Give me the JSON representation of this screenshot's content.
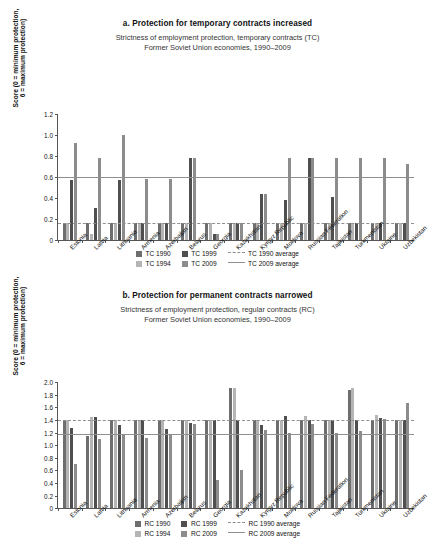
{
  "chart_data": [
    {
      "type": "bar",
      "id": "panel-a",
      "title": "a. Protection for temporary contracts increased",
      "subtitle_line1": "Strictness of employment protection, temporary contracts (TC)",
      "subtitle_line2": "Former Soviet Union economies, 1990–2009",
      "ylabel": "Score (0 = minimum protection,\n6 = maximum protection)",
      "xlabel": "",
      "ylim": [
        0,
        1.2
      ],
      "ytick_step": 0.2,
      "yticks": [
        "0",
        "0.2",
        "0.4",
        "0.6",
        "0.8",
        "1.0",
        "1.2"
      ],
      "grid": false,
      "legend_position": "bottom",
      "categories": [
        "Estonia",
        "Latvia",
        "Lithuania",
        "Armenia",
        "Azerbaijan",
        "Belarus",
        "Georgia",
        "Kazakhstan",
        "Kyrgyz Republic",
        "Moldova",
        "Russian Federation",
        "Tajikistan",
        "Turkmenistan",
        "Ukraine",
        "Uzbekistan"
      ],
      "series": [
        {
          "name": "TC 1990",
          "color": "#6e6e6e",
          "values": [
            0.16,
            0.16,
            0.16,
            0.16,
            0.16,
            0.16,
            0.16,
            0.16,
            0.16,
            0.16,
            0.16,
            0.16,
            0.16,
            0.16,
            0.16
          ]
        },
        {
          "name": "TC 1994",
          "color": "#b5b5b5",
          "values": [
            0.16,
            0.06,
            0.16,
            0.16,
            0.16,
            0.16,
            0.16,
            0.16,
            0.16,
            0.16,
            0.16,
            0.16,
            0.16,
            0.16,
            0.16
          ]
        },
        {
          "name": "TC 1999",
          "color": "#4f4f4f",
          "values": [
            0.57,
            0.31,
            0.57,
            0.16,
            0.16,
            0.78,
            0.06,
            0.16,
            0.44,
            0.38,
            0.78,
            0.41,
            0.16,
            0.16,
            0.16
          ]
        },
        {
          "name": "TC 2009",
          "color": "#8c8c8c",
          "values": [
            0.93,
            0.78,
            1.0,
            0.58,
            0.58,
            0.78,
            0.06,
            0.16,
            0.44,
            0.78,
            0.78,
            0.78,
            0.78,
            0.78,
            0.73
          ]
        }
      ],
      "reference_lines": [
        {
          "name": "TC 1990 average",
          "value": 0.16,
          "style": "dashed",
          "color": "#8f8f8f"
        },
        {
          "name": "TC 2009 average",
          "value": 0.6,
          "style": "solid",
          "color": "#8f8f8f"
        }
      ]
    },
    {
      "type": "bar",
      "id": "panel-b",
      "title": "b. Protection for permanent contracts narrowed",
      "subtitle_line1": "Strictness of employment protection, regular contracts (RC)",
      "subtitle_line2": "Former Soviet Union economies, 1990–2009",
      "ylabel": "Score (0 = minimum protection,\n6 = maximum protection)",
      "xlabel": "",
      "ylim": [
        0,
        2.0
      ],
      "ytick_step": 0.2,
      "yticks": [
        "0",
        "0.2",
        "0.4",
        "0.6",
        "0.8",
        "1.0",
        "1.2",
        "1.4",
        "1.6",
        "1.8",
        "2.0"
      ],
      "grid": false,
      "legend_position": "bottom",
      "categories": [
        "Estonia",
        "Latvia",
        "Lithuania",
        "Armenia",
        "Azerbaijan",
        "Belarus",
        "Georgia",
        "Kazakhstan",
        "Kyrgyz Republic",
        "Moldova",
        "Russian Federation",
        "Tajikistan",
        "Turkmenistan",
        "Ukraine",
        "Uzbekistan"
      ],
      "series": [
        {
          "name": "RC 1990",
          "color": "#6e6e6e",
          "values": [
            1.4,
            1.14,
            1.4,
            1.4,
            1.4,
            1.4,
            1.4,
            1.91,
            1.4,
            1.4,
            1.4,
            1.4,
            1.88,
            1.4,
            1.4
          ]
        },
        {
          "name": "RC 1994",
          "color": "#b5b5b5",
          "values": [
            1.4,
            1.45,
            1.4,
            1.4,
            1.4,
            1.4,
            1.4,
            1.91,
            1.4,
            1.4,
            1.46,
            1.4,
            1.91,
            1.48,
            1.4
          ]
        },
        {
          "name": "RC 1999",
          "color": "#4f4f4f",
          "values": [
            1.27,
            1.45,
            1.32,
            1.4,
            1.26,
            1.36,
            1.4,
            1.4,
            1.32,
            1.46,
            1.4,
            1.4,
            1.4,
            1.43,
            1.4
          ]
        },
        {
          "name": "RC 2009",
          "color": "#8c8c8c",
          "values": [
            0.7,
            1.1,
            1.17,
            1.11,
            1.17,
            1.34,
            0.44,
            0.6,
            1.24,
            1.2,
            1.34,
            1.19,
            1.23,
            1.41,
            1.67
          ]
        }
      ],
      "reference_lines": [
        {
          "name": "RC 1990 average",
          "value": 1.4,
          "style": "dashed",
          "color": "#8f8f8f"
        },
        {
          "name": "RC 2009 average",
          "value": 1.17,
          "style": "solid",
          "color": "#8f8f8f"
        }
      ]
    }
  ]
}
